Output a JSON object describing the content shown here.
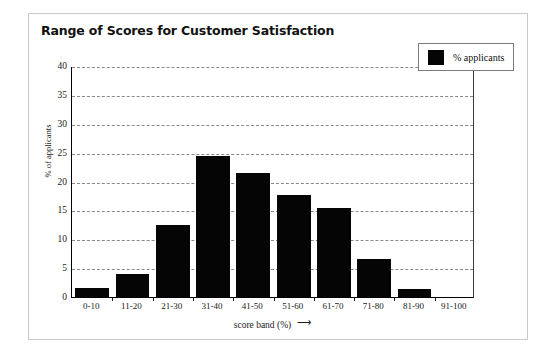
{
  "chart_data": {
    "type": "bar",
    "title": "Range of Scores for Customer Satisfaction",
    "xlabel": "score band (%)",
    "ylabel": "% of applicants",
    "categories": [
      "0-10",
      "11-20",
      "21-30",
      "31-40",
      "41-50",
      "51-60",
      "61-70",
      "71-80",
      "81-90",
      "91-100"
    ],
    "values": [
      1.5,
      4.0,
      12.5,
      24.4,
      21.4,
      17.7,
      15.4,
      6.5,
      1.4,
      0
    ],
    "series": [
      {
        "name": "% applicants",
        "values": [
          1.5,
          4.0,
          12.5,
          24.4,
          21.4,
          17.7,
          15.4,
          6.5,
          1.4,
          0
        ],
        "color": "#050505"
      }
    ],
    "ylim": [
      0,
      40
    ],
    "yticks": [
      0,
      5,
      10,
      15,
      20,
      25,
      30,
      35,
      40
    ],
    "ytick_labels": [
      "0",
      "5",
      "10",
      "15",
      "20",
      "25",
      "30",
      "35",
      "40"
    ],
    "grid": true,
    "grid_axis": "y",
    "grid_style": "dashed",
    "grid_color": "#8a8a8a",
    "legend_position": "top-right",
    "bar_color": "#050505",
    "background_color": "#ffffff",
    "frame_color": "#c9c9c9"
  },
  "legend": {
    "entries": [
      {
        "label": "% applicants",
        "color": "#050505"
      }
    ]
  },
  "axis": {
    "x_arrow": "➤"
  }
}
